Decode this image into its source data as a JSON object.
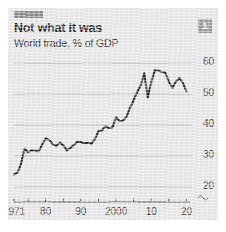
{
  "card": {
    "badge_label": "1",
    "top_rule_color": "#8c8c8c",
    "background_color": "#e9e9e9",
    "line_color": "#2a2a2a",
    "gridline_color": "#b4b4b4"
  },
  "chart_data": {
    "type": "line",
    "title": "Not what it was",
    "subtitle": "World trade, % of GDP",
    "xlabel": "",
    "ylabel": "",
    "ylim": [
      18,
      63
    ],
    "xlim": [
      1971,
      2021
    ],
    "grid": true,
    "legend": "none",
    "axis_break": true,
    "yticks": [
      60,
      50,
      40,
      30,
      20
    ],
    "ytick_labels": [
      "60",
      "50",
      "40",
      "30",
      "20"
    ],
    "xticks": [
      1971,
      1975,
      1980,
      1985,
      1990,
      1995,
      2000,
      2005,
      2010,
      2015,
      2020
    ],
    "xtick_labels": [
      "1971",
      "80",
      "90",
      "2000",
      "10",
      "20"
    ],
    "xtick_label_years": [
      1971,
      1980,
      1990,
      2000,
      2010,
      2020
    ],
    "series": [
      {
        "name": "World trade, % of GDP",
        "x": [
          1971,
          1972,
          1973,
          1974,
          1975,
          1976,
          1977,
          1978,
          1979,
          1980,
          1981,
          1982,
          1983,
          1984,
          1985,
          1986,
          1987,
          1988,
          1989,
          1990,
          1991,
          1992,
          1993,
          1994,
          1995,
          1996,
          1997,
          1998,
          1999,
          2000,
          2001,
          2002,
          2003,
          2004,
          2005,
          2006,
          2007,
          2008,
          2009,
          2010,
          2011,
          2012,
          2013,
          2014,
          2015,
          2016,
          2017,
          2018,
          2019,
          2020
        ],
        "values": [
          24.0,
          24.6,
          27.5,
          32.3,
          31.2,
          31.8,
          31.7,
          31.5,
          33.6,
          35.7,
          35.2,
          33.8,
          33.2,
          34.3,
          33.5,
          31.8,
          32.6,
          33.5,
          34.6,
          34.5,
          34.1,
          34.3,
          33.9,
          35.5,
          38.0,
          38.3,
          39.6,
          39.0,
          39.3,
          42.5,
          41.3,
          41.4,
          42.8,
          45.6,
          48.1,
          50.7,
          52.8,
          56.8,
          48.9,
          53.9,
          57.7,
          57.6,
          57.2,
          57.0,
          54.0,
          52.1,
          54.0,
          55.2,
          53.6,
          50.9
        ]
      }
    ]
  }
}
